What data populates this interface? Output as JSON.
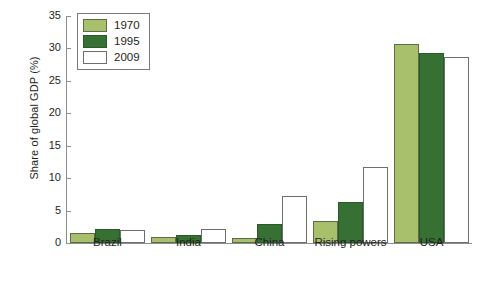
{
  "chart_data": {
    "type": "bar",
    "title": "",
    "xlabel": "",
    "ylabel": "Share of global GDP (%)",
    "ylim": [
      0,
      35
    ],
    "ytick_step": 5,
    "yticks": [
      35,
      30,
      25,
      20,
      15,
      10,
      5,
      0
    ],
    "grid": false,
    "legend_position": "top-left",
    "categories": [
      "Brazil",
      "India",
      "China",
      "Rising powers",
      "USA"
    ],
    "series": [
      {
        "name": "1970",
        "color": "#a8bf6c",
        "values": [
          1.6,
          0.9,
          0.8,
          3.4,
          30.7
        ]
      },
      {
        "name": "1995",
        "color": "#367033",
        "values": [
          2.1,
          1.2,
          2.9,
          6.3,
          29.3
        ]
      },
      {
        "name": "2009",
        "color": "#ffffff",
        "values": [
          2.0,
          2.1,
          7.2,
          11.7,
          28.7
        ]
      }
    ]
  },
  "legend": {
    "items": [
      {
        "label": "1970",
        "swatch": "s1970"
      },
      {
        "label": "1995",
        "swatch": "s1995"
      },
      {
        "label": "2009",
        "swatch": "s2009"
      }
    ]
  },
  "axis": {
    "y_title": "Share of global GDP (%)",
    "y_labels": [
      "35",
      "30",
      "25",
      "20",
      "15",
      "10",
      "5",
      "0"
    ]
  },
  "colors": {
    "series_1970": "#a8bf6c",
    "series_1995": "#367033",
    "series_2009": "#ffffff",
    "axis": "#8d8d8d",
    "text": "#231f20",
    "bar_outline_green": "#5c6b4a",
    "bar_outline_white": "#6e6e6e"
  }
}
